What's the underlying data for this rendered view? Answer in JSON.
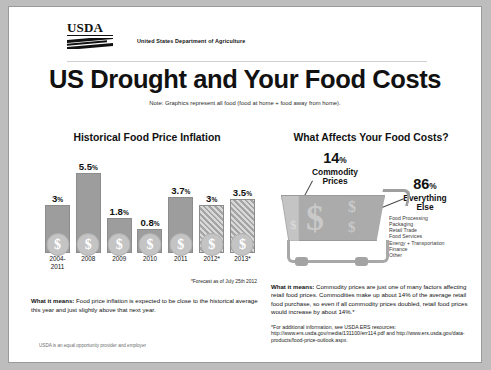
{
  "header": {
    "logo_text": "USDA",
    "agency": "United States Department of Agriculture"
  },
  "title": "US Drought and Your Food Costs",
  "note": "Note: Graphics represent all food (food at home + food away from home).",
  "left": {
    "section_title": "Historical Food Price Inflation",
    "forecast_note": "*Forecast as of July 25th 2012",
    "what_it_means_label": "What it means:",
    "what_it_means": " Food price inflation is expected to be close to the historical average this year and just slightly above that next year."
  },
  "right": {
    "section_title": "What Affects Your Food Costs?",
    "commodity_pct": "14",
    "commodity_pct_sym": "%",
    "commodity_label_1": "Commodity",
    "commodity_label_2": "Prices",
    "everything_pct": "86",
    "everything_pct_sym": "%",
    "everything_label_1": "Everything",
    "everything_label_2": "Else",
    "everything_items": [
      "Food Processing",
      "Packaging",
      "Retail Trade",
      "Food Services",
      "Energy + Transportation",
      "Finance",
      "Other"
    ],
    "what_it_means_label": "What it means:",
    "what_it_means": " Commodity prices are just one of many factors affecting retail food prices. Commodities make up about 14% of the average retail food purchase, so even if all commodity prices doubled, retail food prices would increase by about 14%.*",
    "reference": "*For additional information, see USDA ERS resources: http://www.ers.usda.gov/media/131100/err114.pdf and http://www.ers.usda.gov/data-products/food-price-outlook.aspx."
  },
  "footer": "USDA is an equal opportunity provider and employer",
  "chart_data": {
    "type": "bar",
    "title": "Historical Food Price Inflation",
    "xlabel": "",
    "ylabel": "Food price inflation (%)",
    "ylim": [
      0,
      5.5
    ],
    "grid": false,
    "legend": "none",
    "categories": [
      "2004-\n2011",
      "2008",
      "2009",
      "2010",
      "2011",
      "2012*",
      "2013*"
    ],
    "values": [
      3,
      5.5,
      1.8,
      0.8,
      3.7,
      3,
      3.5
    ],
    "value_labels": [
      "3%",
      "5.5%",
      "1.8%",
      "0.8%",
      "3.7%",
      "3%",
      "3.5%"
    ],
    "forecast_flags": [
      false,
      false,
      false,
      false,
      false,
      true,
      true
    ],
    "annotation": "*Forecast as of July 25th 2012"
  },
  "chart_data_2": {
    "type": "pie",
    "title": "What Affects Your Food Costs?",
    "labels": [
      "Commodity Prices",
      "Everything Else"
    ],
    "values": [
      14,
      86
    ],
    "value_labels": [
      "14%",
      "86%"
    ]
  },
  "bars": [
    {
      "label_line1": "2004-",
      "label_line2": "2011",
      "value_num": "3",
      "value_sym": "%",
      "height_pct": 49,
      "forecast": false
    },
    {
      "label_line1": "2008",
      "label_line2": "",
      "value_num": "5.5",
      "value_sym": "%",
      "height_pct": 82,
      "forecast": false
    },
    {
      "label_line1": "2009",
      "label_line2": "",
      "value_num": "1.8",
      "value_sym": "%",
      "height_pct": 36,
      "forecast": false
    },
    {
      "label_line1": "2010",
      "label_line2": "",
      "value_num": "0.8",
      "value_sym": "%",
      "height_pct": 24,
      "forecast": false
    },
    {
      "label_line1": "2011",
      "label_line2": "",
      "value_num": "3.7",
      "value_sym": "%",
      "height_pct": 57,
      "forecast": false
    },
    {
      "label_line1": "2012*",
      "label_line2": "",
      "value_num": "3",
      "value_sym": "%",
      "height_pct": 49,
      "forecast": true
    },
    {
      "label_line1": "2013*",
      "label_line2": "",
      "value_num": "3.5",
      "value_sym": "%",
      "height_pct": 55,
      "forecast": true
    }
  ],
  "icons": {
    "dollar": "$"
  }
}
